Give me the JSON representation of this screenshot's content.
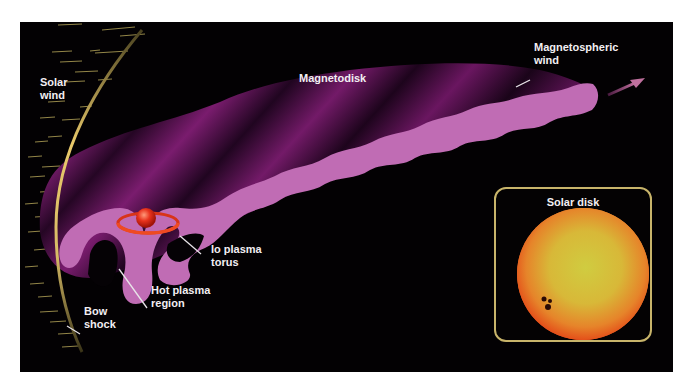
{
  "diagram": {
    "labels": {
      "solar_wind": "Solar\nwind",
      "magnetodisk": "Magnetodisk",
      "magnetospheric_wind": "Magnetospheric\nwind",
      "io_plasma_torus": "Io plasma\ntorus",
      "hot_plasma_region": "Hot plasma\nregion",
      "bow_shock": "Bow\nshock"
    },
    "inset": {
      "title": "Solar disk"
    },
    "colors": {
      "background": "#030103",
      "magnetodisk": "#7a1f6e",
      "plasma_sheet": "#c06cb4",
      "bow_shock": "#e8c86a",
      "io_torus": "#e03a1c",
      "sun_core": "#d9c23a",
      "sun_limb": "#e8561a",
      "inset_border": "#c8b46a",
      "label_text": "#f2eef2"
    }
  }
}
